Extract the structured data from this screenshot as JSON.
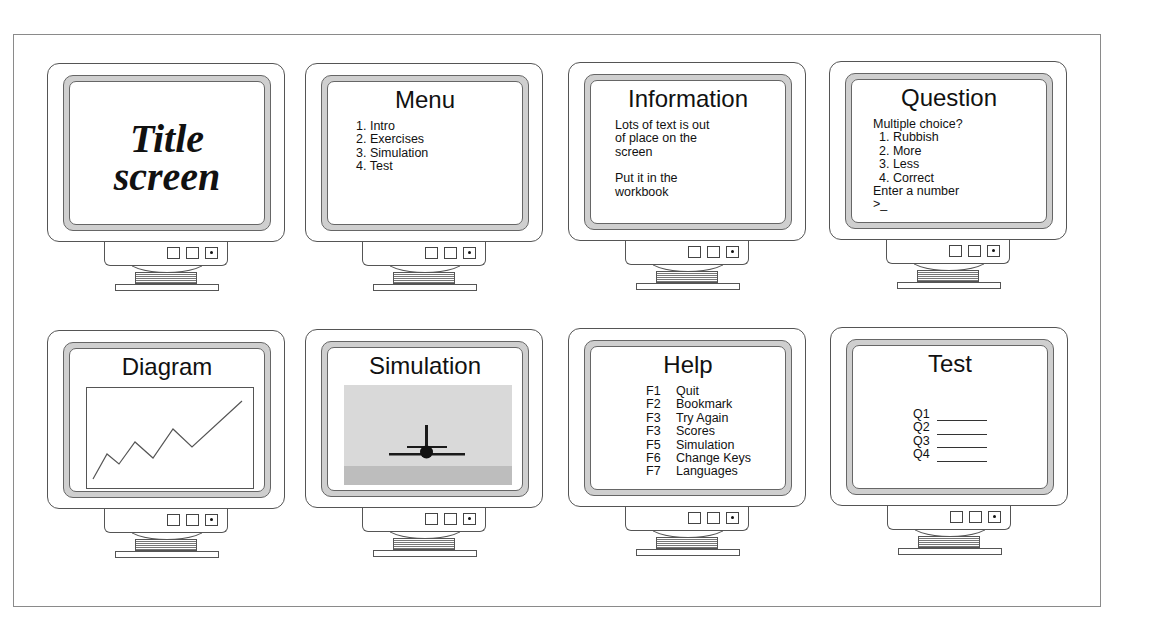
{
  "figure": {
    "layout": "2 rows x 4 columns"
  },
  "screens": {
    "title_screen": {
      "title_line1": "Title",
      "title_line2": "screen"
    },
    "menu": {
      "title": "Menu",
      "items": [
        {
          "num": "1.",
          "label": "Intro"
        },
        {
          "num": "2.",
          "label": "Exercises"
        },
        {
          "num": "3.",
          "label": "Simulation"
        },
        {
          "num": "4.",
          "label": "Test"
        }
      ]
    },
    "information": {
      "title": "Information",
      "paragraph1": [
        "Lots of text is out",
        "of place on the",
        "screen"
      ],
      "paragraph2": [
        "Put it in the",
        "workbook"
      ]
    },
    "question": {
      "title": "Question",
      "prompt": "Multiple choice?",
      "options": [
        {
          "num": "1.",
          "label": "Rubbish"
        },
        {
          "num": "2.",
          "label": "More"
        },
        {
          "num": "3.",
          "label": "Less"
        },
        {
          "num": "4.",
          "label": "Correct"
        }
      ],
      "instruction": "Enter a number",
      "input_prompt": ">_"
    },
    "diagram": {
      "title": "Diagram",
      "line_points": [
        [
          6,
          91
        ],
        [
          20,
          66
        ],
        [
          32,
          76
        ],
        [
          48,
          54
        ],
        [
          66,
          70
        ],
        [
          86,
          41
        ],
        [
          105,
          59
        ],
        [
          155,
          13
        ]
      ]
    },
    "simulation": {
      "title": "Simulation",
      "sky_color": "#d9d9d9",
      "ground_color": "#bdbdbd",
      "object": "jet aircraft (front view)"
    },
    "help": {
      "title": "Help",
      "keys": [
        {
          "key": "F1",
          "action": "Quit"
        },
        {
          "key": "F2",
          "action": "Bookmark"
        },
        {
          "key": "F3",
          "action": "Try Again"
        },
        {
          "key": "F3",
          "action": "Scores"
        },
        {
          "key": "F5",
          "action": "Simulation"
        },
        {
          "key": "F6",
          "action": "Change Keys"
        },
        {
          "key": "F7",
          "action": "Languages"
        }
      ]
    },
    "test": {
      "title": "Test",
      "questions": [
        {
          "label": "Q1"
        },
        {
          "label": "Q2"
        },
        {
          "label": "Q3"
        },
        {
          "label": "Q4"
        }
      ]
    }
  },
  "colors": {
    "bezel_ring": "#cfcfcf",
    "outline": "#555555",
    "frame": "#8a8a8a"
  }
}
